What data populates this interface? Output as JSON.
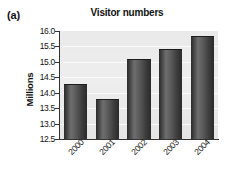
{
  "panel": {
    "label": "(a)"
  },
  "chart_data": {
    "type": "bar",
    "title": "Visitor numbers",
    "xlabel": "",
    "ylabel": "Millions",
    "categories": [
      "2000",
      "2001",
      "2002",
      "2003",
      "2004"
    ],
    "values": [
      14.25,
      13.75,
      15.05,
      15.4,
      15.8
    ],
    "ylim": [
      12.5,
      16.0
    ],
    "ytick_labels": [
      "16.0",
      "15.5",
      "15.0",
      "14.5",
      "14.0",
      "13.5",
      "13.0",
      "12.5"
    ],
    "ytick_values": [
      16.0,
      15.5,
      15.0,
      14.5,
      14.0,
      13.5,
      13.0,
      12.5
    ],
    "ytick_step": 0.5,
    "grid": true,
    "grid_axis": "y",
    "legend": false,
    "xtick_rotation": -45,
    "colors": {
      "bar_dark": "#2b2b2b",
      "bar_light": "#6e6e6e",
      "plot_background": "#eaeaea",
      "gridline": "#fbfbfb",
      "axis": "#333333",
      "text": "#111111",
      "page_background": "#ffffff"
    }
  }
}
